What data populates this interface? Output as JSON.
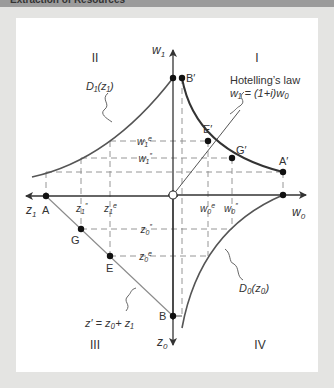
{
  "header": {
    "title": "Extraction of Resources"
  },
  "diagram": {
    "colors": {
      "background": "#e4e4e2",
      "panel": "#ffffff",
      "axis": "#333333",
      "curve": "#444444",
      "dashed": "#888888",
      "line": "#777777"
    },
    "quadrants": {
      "q1": "I",
      "q2": "II",
      "q3": "III",
      "q4": "IV"
    },
    "axes": {
      "w1": "w",
      "w1_sub": "1",
      "w0": "w",
      "w0_sub": "0",
      "z1": "z",
      "z1_sub": "1",
      "z0": "z",
      "z0_sub": "0"
    },
    "points": {
      "A": "A",
      "A_prime": "A′",
      "B": "B",
      "B_prime": "B′",
      "E": "E",
      "E_prime": "E′",
      "G": "G",
      "G_prime": "G′"
    },
    "tick_labels": {
      "w1e": "w",
      "w1e_sup": "e",
      "w1pp": "w",
      "w1pp_sup": "″",
      "w0e": "w",
      "w0e_sup": "e",
      "w0pp": "w",
      "w0pp_sup": "″",
      "z1pp": "z",
      "z1pp_sup": "″",
      "z1e": "z",
      "z1e_sup": "e",
      "z0pp": "z",
      "z0pp_sup": "″",
      "z0e": "z",
      "z0e_sup": "e"
    },
    "annotations": {
      "hotelling_title": "Hotelling’s law",
      "hotelling_eq": "w₁ = (1+i)w₀",
      "d1": "D₁(z₁)",
      "d0": "D₀(z₀)",
      "budget": "z′ = z₀+ z₁"
    }
  }
}
